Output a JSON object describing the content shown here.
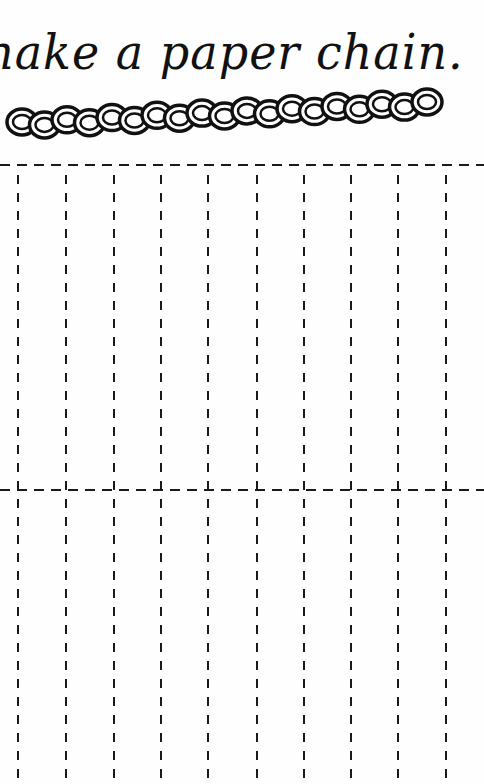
{
  "page": {
    "title": "nake a paper chain.",
    "illustration": "paper-chain-illustration",
    "ink_color": "#111111",
    "background_color": "#fefefe"
  },
  "cut_grid": {
    "line_style": "dashed",
    "columns": 10,
    "rows": 2,
    "horizontal_lines_y": [
      165,
      490
    ],
    "vertical_lines_x": [
      18,
      66,
      114,
      161,
      208,
      257,
      304,
      351,
      398,
      446
    ],
    "grid_bottom_y": 784
  }
}
